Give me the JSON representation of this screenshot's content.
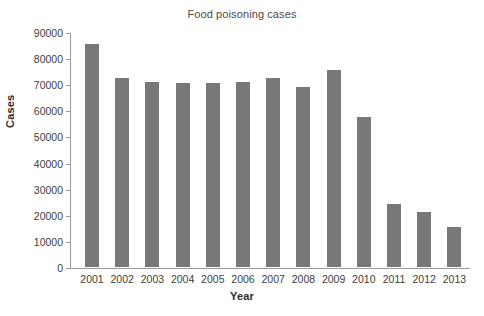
{
  "chart_data": {
    "type": "bar",
    "title": "Food poisoning cases",
    "xlabel": "Year",
    "ylabel": "Cases",
    "categories": [
      "2001",
      "2002",
      "2003",
      "2004",
      "2005",
      "2006",
      "2007",
      "2008",
      "2009",
      "2010",
      "2011",
      "2012",
      "2013"
    ],
    "values": [
      85400,
      72500,
      70800,
      70300,
      70500,
      70800,
      72500,
      69000,
      75300,
      57400,
      24100,
      21100,
      15400
    ],
    "ylim": [
      0,
      90000
    ],
    "ytick_labels": [
      "90000",
      "80000",
      "70000",
      "60000",
      "50000",
      "40000",
      "30000",
      "20000",
      "10000",
      "0"
    ],
    "ytick_values": [
      90000,
      80000,
      70000,
      60000,
      50000,
      40000,
      30000,
      20000,
      10000,
      0
    ],
    "grid": false,
    "legend": false,
    "bar_color": "#787878",
    "axis_color": "#9a9a9a",
    "background": "#ffffff"
  }
}
